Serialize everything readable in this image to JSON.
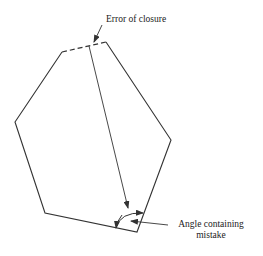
{
  "diagram": {
    "type": "traverse-error-of-closure",
    "labels": {
      "error_of_closure": "Error of closure",
      "angle_line1": "Angle containing",
      "angle_line2": "mistake"
    },
    "polygon_vertices": [
      [
        62,
        52
      ],
      [
        15,
        122
      ],
      [
        45,
        213
      ],
      [
        137,
        232
      ],
      [
        171,
        140
      ],
      [
        106,
        42
      ]
    ],
    "closure_gap": {
      "from": [
        62,
        52
      ],
      "to": [
        106,
        42
      ],
      "style": "dashed"
    },
    "colors": {
      "stroke": "#333333",
      "background": "#ffffff"
    }
  }
}
